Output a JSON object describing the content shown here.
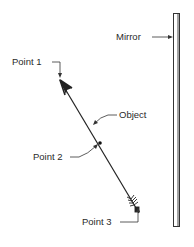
{
  "diagram": {
    "title": "",
    "labels": {
      "mirror": "Mirror",
      "point1": "Point 1",
      "object": "Object",
      "point2": "Point 2",
      "point3": "Point 3"
    },
    "colors": {
      "ink": "#2a2a2a",
      "background": "#ffffff"
    },
    "elements": [
      {
        "id": "mirror",
        "type": "plane-mirror",
        "orientation": "vertical"
      },
      {
        "id": "object",
        "type": "arrow",
        "description": "diagonal arrow with head at Point 1 and fletching at Point 3"
      },
      {
        "id": "point1",
        "type": "point",
        "location": "arrow tip"
      },
      {
        "id": "point2",
        "type": "point",
        "location": "midpoint of arrow shaft"
      },
      {
        "id": "point3",
        "type": "point",
        "location": "arrow tail"
      }
    ]
  }
}
